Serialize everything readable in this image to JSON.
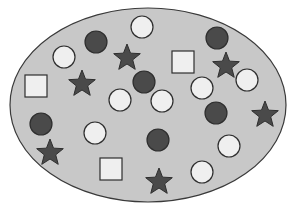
{
  "diagram": {
    "type": "set-of-shapes",
    "container": {
      "shape": "ellipse",
      "cx": 148,
      "cy": 105,
      "rx": 138,
      "ry": 97,
      "fill": "#c8c8c8",
      "stroke": "#3a3a3a"
    },
    "colors": {
      "white_fill": "#efefef",
      "dark_fill": "#4a4a4a",
      "stroke": "#2e2e2e"
    },
    "counts": {
      "white_circles": 9,
      "dark_circles": 6,
      "stars": 6,
      "squares": 3
    },
    "white_circles": [
      {
        "cx": 142,
        "cy": 27
      },
      {
        "cx": 64,
        "cy": 57
      },
      {
        "cx": 202,
        "cy": 88
      },
      {
        "cx": 247,
        "cy": 80
      },
      {
        "cx": 120,
        "cy": 100
      },
      {
        "cx": 162,
        "cy": 101
      },
      {
        "cx": 95,
        "cy": 133
      },
      {
        "cx": 229,
        "cy": 146
      },
      {
        "cx": 202,
        "cy": 172
      }
    ],
    "dark_circles": [
      {
        "cx": 96,
        "cy": 42
      },
      {
        "cx": 217,
        "cy": 38
      },
      {
        "cx": 144,
        "cy": 82
      },
      {
        "cx": 216,
        "cy": 113
      },
      {
        "cx": 41,
        "cy": 124
      },
      {
        "cx": 158,
        "cy": 140
      }
    ],
    "stars": [
      {
        "cx": 127,
        "cy": 57
      },
      {
        "cx": 226,
        "cy": 65
      },
      {
        "cx": 82,
        "cy": 83
      },
      {
        "cx": 265,
        "cy": 114
      },
      {
        "cx": 50,
        "cy": 152
      },
      {
        "cx": 159,
        "cy": 181
      }
    ],
    "squares": [
      {
        "x": 25,
        "y": 75,
        "size": 22
      },
      {
        "x": 172,
        "y": 51,
        "size": 22
      },
      {
        "x": 100,
        "y": 158,
        "size": 22
      }
    ]
  }
}
